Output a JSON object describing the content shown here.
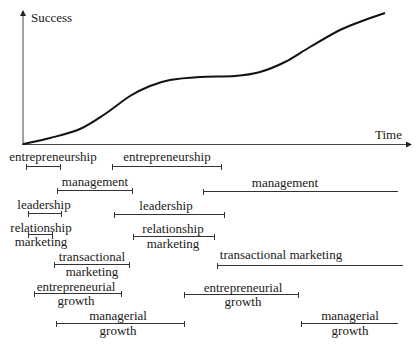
{
  "axes": {
    "y_label": "Success",
    "x_label": "Time"
  },
  "curve": {
    "description": "S-shaped success curve with plateau then second rise",
    "points": [
      [
        23,
        144
      ],
      [
        50,
        138
      ],
      [
        80,
        129
      ],
      [
        105,
        114
      ],
      [
        130,
        96
      ],
      [
        150,
        86
      ],
      [
        170,
        80
      ],
      [
        200,
        77
      ],
      [
        235,
        76
      ],
      [
        260,
        72
      ],
      [
        285,
        62
      ],
      [
        310,
        47
      ],
      [
        340,
        30
      ],
      [
        365,
        20
      ],
      [
        385,
        13
      ]
    ]
  },
  "bars": [
    {
      "id": "entrepreneurship-1",
      "lines": [
        "entrepreneurship"
      ],
      "x1": 26,
      "x2": 61,
      "bar_y": 166,
      "text_y": 150,
      "label_pos": "above",
      "text_x": 53
    },
    {
      "id": "entrepreneurship-2",
      "lines": [
        "entrepreneurship"
      ],
      "x1": 112,
      "x2": 222,
      "bar_y": 166,
      "text_y": 150,
      "label_pos": "above",
      "text_x": 167
    },
    {
      "id": "management-1",
      "lines": [
        "management"
      ],
      "x1": 57,
      "x2": 133,
      "bar_y": 190,
      "text_y": 175,
      "label_pos": "above",
      "text_x": 95
    },
    {
      "id": "management-2",
      "lines": [
        "management"
      ],
      "x1": 203,
      "x2": 398,
      "bar_y": 191,
      "text_y": 176,
      "label_pos": "above",
      "text_x": 285,
      "open_right": true
    },
    {
      "id": "leadership-1",
      "lines": [
        "leadership"
      ],
      "x1": 28,
      "x2": 62,
      "bar_y": 213,
      "text_y": 198,
      "label_pos": "above",
      "text_x": 44
    },
    {
      "id": "leadership-2",
      "lines": [
        "leadership"
      ],
      "x1": 114,
      "x2": 225,
      "bar_y": 214,
      "text_y": 199,
      "label_pos": "above",
      "text_x": 166
    },
    {
      "id": "relationship-marketing-1",
      "lines": [
        "relationship",
        "marketing"
      ],
      "x1": 28,
      "x2": 53,
      "bar_y": 234,
      "text_y": 221,
      "label_pos": "around",
      "text_x": 41
    },
    {
      "id": "relationship-marketing-2",
      "lines": [
        "relationship",
        "marketing"
      ],
      "x1": 133,
      "x2": 215,
      "bar_y": 236,
      "text_y": 222,
      "label_pos": "around",
      "text_x": 173
    },
    {
      "id": "transactional-marketing-1",
      "lines": [
        "transactional",
        "marketing"
      ],
      "x1": 54,
      "x2": 130,
      "bar_y": 264,
      "text_y": 250,
      "label_pos": "around",
      "text_x": 92
    },
    {
      "id": "transactional-marketing-2",
      "lines": [
        "transactional marketing"
      ],
      "x1": 217,
      "x2": 403,
      "bar_y": 265,
      "text_y": 248,
      "label_pos": "above",
      "text_x": 281,
      "open_right": true
    },
    {
      "id": "entrepreneurial-growth-1",
      "lines": [
        "entrepreneurial",
        "growth"
      ],
      "x1": 34,
      "x2": 122,
      "bar_y": 293,
      "text_y": 280,
      "label_pos": "around",
      "text_x": 76
    },
    {
      "id": "entrepreneurial-growth-2",
      "lines": [
        "entrepreneurial",
        "growth"
      ],
      "x1": 184,
      "x2": 299,
      "bar_y": 294,
      "text_y": 281,
      "label_pos": "around",
      "text_x": 243
    },
    {
      "id": "managerial-growth-1",
      "lines": [
        "managerial",
        "growth"
      ],
      "x1": 56,
      "x2": 185,
      "bar_y": 323,
      "text_y": 309,
      "label_pos": "around",
      "text_x": 118
    },
    {
      "id": "managerial-growth-2",
      "lines": [
        "managerial",
        "growth"
      ],
      "x1": 301,
      "x2": 398,
      "bar_y": 323,
      "text_y": 309,
      "label_pos": "around",
      "text_x": 350,
      "open_right": true
    }
  ]
}
